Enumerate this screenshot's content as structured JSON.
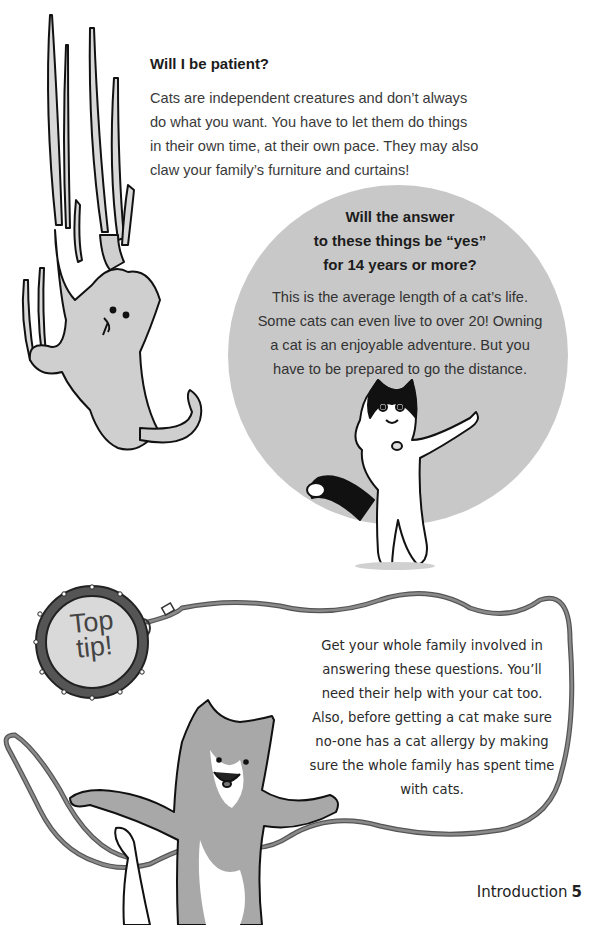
{
  "section": {
    "heading": "Will I be patient?",
    "body_lines": [
      "Cats are independent creatures and don’t always",
      "do what you want. You have to let them do things",
      "in their own time, at their own pace. They may also",
      "claw your family’s furniture and curtains!"
    ]
  },
  "callout": {
    "heading_lines": [
      "Will the answer",
      "to these things be “yes”",
      "for 14 years or more?"
    ],
    "body_lines": [
      "This is the average length of a cat’s life.",
      "Some cats can even live to over 20! Owning",
      "a cat is an enjoyable adventure. But you",
      "have to be prepared to go the distance."
    ],
    "circle_color": "#c8c8c8"
  },
  "tip": {
    "tag_lines": [
      "Top",
      "tip!"
    ],
    "body_lines": [
      "Get your whole family involved in",
      "answering these questions. You’ll",
      "need their help with your cat too.",
      "Also, before getting a cat make sure",
      "no-one has a cat allergy by making",
      "sure the whole family has spent time",
      "with cats."
    ],
    "leash_color": "#6e6e6e",
    "tag_fill": "#d9d9d9"
  },
  "footer": {
    "section": "Introduction",
    "page_number": "5"
  },
  "illustrations": {
    "climbing_cat": "climbing-cat-illustration",
    "tuxedo_cat": "tuxedo-cat-illustration",
    "tabby_cat": "tabby-cat-illustration"
  }
}
